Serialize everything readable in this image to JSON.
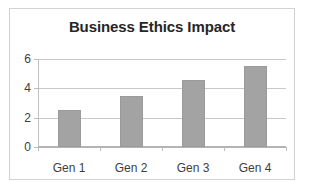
{
  "chart_data": {
    "type": "bar",
    "title": "Business Ethics Impact",
    "xlabel": "",
    "ylabel": "",
    "categories": [
      "Gen 1",
      "Gen 2",
      "Gen 3",
      "Gen 4"
    ],
    "values": [
      2.5,
      3.5,
      4.6,
      5.5
    ],
    "ylim": [
      0,
      6
    ],
    "ytick_labels": [
      "0",
      "2",
      "4",
      "6"
    ],
    "yticks": [
      0,
      2,
      4,
      6
    ],
    "grid": true,
    "legend": false,
    "legend_position": "none",
    "bar_color": "#a3a3a3",
    "bar_border_color": "#9a9a9a",
    "gridline_color": "#c8c8c8",
    "axis_color": "#b4b4b4",
    "title_color": "#262626",
    "tick_label_color": "#3d3d3d",
    "frame_border_color": "#d2d2d2",
    "background_color": "#ffffff"
  }
}
